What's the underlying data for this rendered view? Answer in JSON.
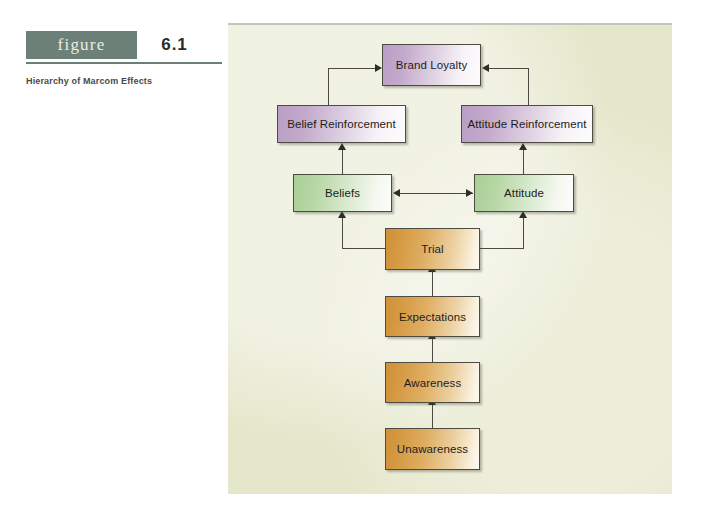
{
  "figure": {
    "tag_label": "figure",
    "number": "6.1",
    "caption": "Hierarchy of Marcom Effects"
  },
  "diagram": {
    "type": "flowchart",
    "title": "Hierarchy of Marcom Effects",
    "colors": {
      "panel_background": "#e5e7cb",
      "header_bar": "#6c8078",
      "purple_node": "#b99ec4",
      "green_node": "#a9cf96",
      "orange_node": "#cf9038",
      "connector": "#4a4a42"
    },
    "nodes": [
      {
        "id": "brand-loyalty",
        "label": "Brand Loyalty",
        "color": "purple",
        "x": 382,
        "y": 44,
        "w": 99,
        "h": 42
      },
      {
        "id": "belief-reinforcement",
        "label": "Belief Reinforcement",
        "color": "purple",
        "x": 277,
        "y": 105,
        "w": 129,
        "h": 38
      },
      {
        "id": "attitude-reinforcement",
        "label": "Attitude Reinforcement",
        "color": "purple",
        "x": 461,
        "y": 105,
        "w": 132,
        "h": 38
      },
      {
        "id": "beliefs",
        "label": "Beliefs",
        "color": "green",
        "x": 293,
        "y": 174,
        "w": 99,
        "h": 38
      },
      {
        "id": "attitude",
        "label": "Attitude",
        "color": "green",
        "x": 474,
        "y": 174,
        "w": 100,
        "h": 38
      },
      {
        "id": "trial",
        "label": "Trial",
        "color": "orange",
        "x": 385,
        "y": 228,
        "w": 95,
        "h": 42
      },
      {
        "id": "expectations",
        "label": "Expectations",
        "color": "orange",
        "x": 385,
        "y": 296,
        "w": 95,
        "h": 41
      },
      {
        "id": "awareness",
        "label": "Awareness",
        "color": "orange",
        "x": 385,
        "y": 362,
        "w": 95,
        "h": 41
      },
      {
        "id": "unawareness",
        "label": "Unawareness",
        "color": "orange",
        "x": 385,
        "y": 428,
        "w": 95,
        "h": 42
      }
    ],
    "edges": [
      {
        "from": "unawareness",
        "to": "awareness",
        "direction": "up"
      },
      {
        "from": "awareness",
        "to": "expectations",
        "direction": "up"
      },
      {
        "from": "expectations",
        "to": "trial",
        "direction": "up"
      },
      {
        "from": "trial",
        "to": "beliefs",
        "direction": "elbow-up-left"
      },
      {
        "from": "trial",
        "to": "attitude",
        "direction": "elbow-up-right"
      },
      {
        "from": "beliefs",
        "to": "attitude",
        "direction": "bidirectional-horizontal"
      },
      {
        "from": "beliefs",
        "to": "belief-reinforcement",
        "direction": "up"
      },
      {
        "from": "attitude",
        "to": "attitude-reinforcement",
        "direction": "up"
      },
      {
        "from": "belief-reinforcement",
        "to": "brand-loyalty",
        "direction": "elbow-up-right"
      },
      {
        "from": "attitude-reinforcement",
        "to": "brand-loyalty",
        "direction": "elbow-up-left"
      }
    ]
  }
}
